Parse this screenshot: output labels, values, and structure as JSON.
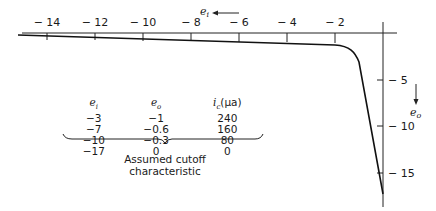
{
  "figure": {
    "type": "tube cutoff characteristic diagram",
    "x_axis": {
      "variable": "e_i",
      "variable_label": "e",
      "variable_sub": "i",
      "direction": "leftward arrow",
      "ticks": [
        "− 14",
        "− 12",
        "− 10",
        "− 8",
        "− 6",
        "− 4",
        "− 2"
      ],
      "tick_values": [
        -14,
        -12,
        -10,
        -8,
        -6,
        -4,
        -2
      ]
    },
    "y_axis": {
      "variable": "e_o",
      "variable_label": "e",
      "variable_sub": "o",
      "direction": "downward arrow",
      "ticks": [
        "− 5",
        "− 10",
        "− 15"
      ],
      "tick_values": [
        5,
        10,
        15
      ]
    },
    "table": {
      "headers": {
        "col1": "e",
        "col1_sub": "i",
        "col2": "e",
        "col2_sub": "o",
        "col3": "i",
        "col3_sub": "c",
        "col3_unit": "(μa)"
      },
      "rows": [
        [
          "−3",
          "−1",
          "240"
        ],
        [
          "−7",
          "−0.6",
          "160"
        ],
        [
          "−10",
          "−0.3",
          "80"
        ],
        [
          "−17",
          "0",
          "0"
        ]
      ]
    },
    "caption_line1": "Assumed cutoff",
    "caption_line2": "characteristic"
  }
}
